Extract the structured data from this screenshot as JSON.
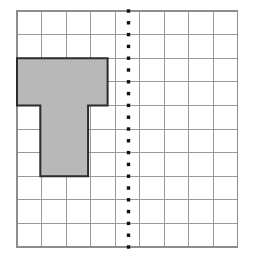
{
  "figure": {
    "kind": "geometry-grid-figure",
    "caption": "",
    "colors": {
      "background": "#ffffff",
      "grid_line": "#9a9a9a",
      "grid_border": "#8d8d8d",
      "shape_fill": "#b8b8b8",
      "shape_stroke": "#2b2b2b",
      "dotted_line": "#101010"
    }
  },
  "grid": {
    "name": "square-grid",
    "columns": 9,
    "rows": 10,
    "origin_px": {
      "x": 17,
      "y": 11
    },
    "cell_width_px": 24.5,
    "cell_height_px": 23.6,
    "width_px": 220.5,
    "height_px": 236,
    "show_border": true,
    "show_interior_lines": true
  },
  "dotted_line": {
    "name": "line-of-symmetry",
    "orientation": "vertical",
    "grid_column_index": 4.5,
    "x_px": 128.5,
    "y_start_px": 11,
    "y_end_px": 247,
    "dot_size_px": 3.4,
    "dot_spacing_px": 11.8,
    "dot_count": 21
  },
  "shape": {
    "name": "shaded-t-polygon",
    "label": "T-shaped polygon",
    "fill": "#b8b8b8",
    "stroke": "#2b2b2b",
    "stroke_width_px": 2,
    "area_cells": 13,
    "vertices_grid": [
      [
        0,
        2
      ],
      [
        3.7,
        2
      ],
      [
        3.7,
        4
      ],
      [
        2.9,
        4
      ],
      [
        2.9,
        7
      ],
      [
        0.95,
        7
      ],
      [
        0.95,
        4
      ],
      [
        0,
        4
      ]
    ],
    "vertices_px": [
      [
        17,
        58.2
      ],
      [
        107.6,
        58.2
      ],
      [
        107.6,
        105.4
      ],
      [
        88.1,
        105.4
      ],
      [
        88.1,
        176.2
      ],
      [
        40.3,
        176.2
      ],
      [
        40.3,
        105.4
      ],
      [
        17,
        105.4
      ]
    ]
  },
  "chart_data": {
    "type": "diagram",
    "grid_columns": 9,
    "grid_rows": 10,
    "shape_polygon_grid_units": [
      [
        0,
        2
      ],
      [
        3.7,
        2
      ],
      [
        3.7,
        4
      ],
      [
        2.9,
        4
      ],
      [
        2.9,
        7
      ],
      [
        0.95,
        7
      ],
      [
        0.95,
        4
      ],
      [
        0,
        4
      ]
    ],
    "dotted_line_grid_x": 4.5,
    "shape_fill": "#b8b8b8",
    "legend": [],
    "annotations": []
  }
}
